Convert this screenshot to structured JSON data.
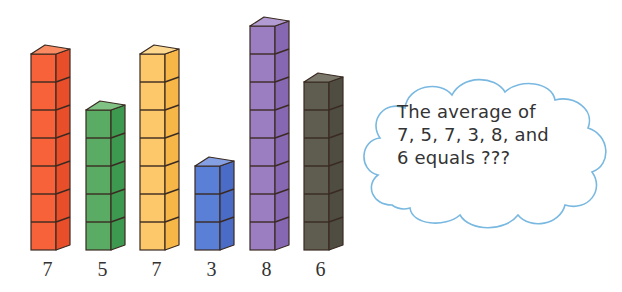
{
  "stacks": [
    {
      "label": "7",
      "count": 7,
      "color": "#f7623a",
      "side": "#e84e2a",
      "top": "#fa8a62",
      "x": 31
    },
    {
      "label": "5",
      "count": 5,
      "color": "#5aab63",
      "side": "#3e9950",
      "top": "#7fc283",
      "x": 86
    },
    {
      "label": "7",
      "count": 7,
      "color": "#fdc86a",
      "side": "#f6b748",
      "top": "#fdd88e",
      "x": 140
    },
    {
      "label": "3",
      "count": 3,
      "color": "#5a7fd6",
      "side": "#4a6cc6",
      "top": "#85a0e2",
      "x": 195
    },
    {
      "label": "8",
      "count": 8,
      "color": "#9b7ec1",
      "side": "#8668b2",
      "top": "#b29bd2",
      "x": 250
    },
    {
      "label": "6",
      "count": 6,
      "color": "#5f5d50",
      "side": "#4f4d42",
      "top": "#7a786b",
      "x": 304
    }
  ],
  "cloud": {
    "line1": "The average of",
    "line2": "7, 5, 7, 3, 8, and",
    "line3": "6 equals ???",
    "outline_color": "#79b8e0"
  },
  "chart_data": {
    "type": "bar",
    "title": "",
    "categories": [
      "orange",
      "green",
      "yellow",
      "blue",
      "purple",
      "black"
    ],
    "values": [
      7,
      5,
      7,
      3,
      8,
      6
    ],
    "xlabel": "",
    "ylabel": "",
    "annotation": "The average of 7, 5, 7, 3, 8, and 6 equals ???"
  }
}
